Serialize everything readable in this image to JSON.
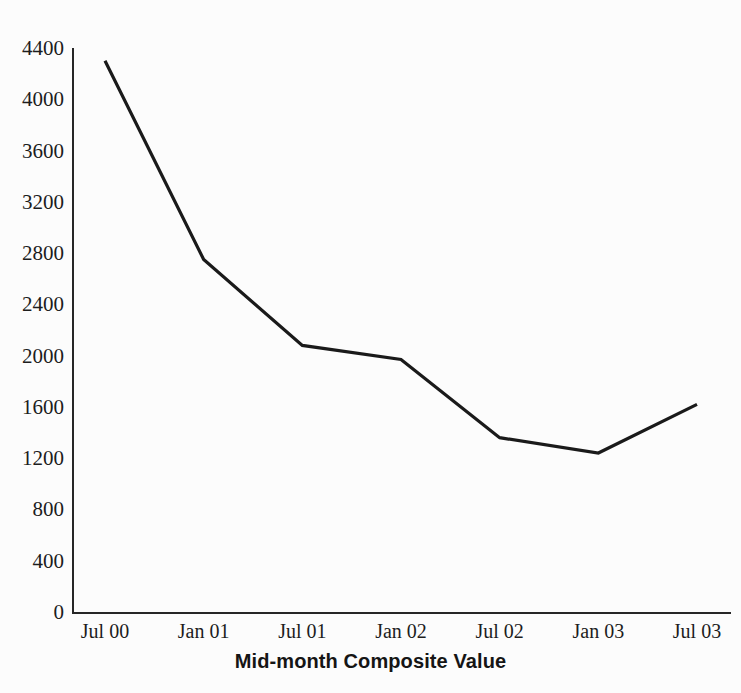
{
  "chart_data": {
    "type": "line",
    "title": "",
    "subtitle": "",
    "xlabel": "Mid-month Composite Value",
    "ylabel": "",
    "categories": [
      "Jul 00",
      "Jan 01",
      "Jul 01",
      "Jan 02",
      "Jul 02",
      "Jan 03",
      "Jul 03"
    ],
    "series": [
      {
        "name": "Composite Value",
        "values": [
          4300,
          2750,
          2080,
          1970,
          1360,
          1240,
          1620
        ]
      }
    ],
    "values": [
      4300,
      2750,
      2080,
      1970,
      1360,
      1240,
      1620
    ],
    "ylim": [
      0,
      4400
    ],
    "y_ticks": [
      0,
      400,
      800,
      1200,
      1600,
      2000,
      2400,
      2800,
      3200,
      3600,
      4000,
      4400
    ],
    "y_tick_labels": [
      "0",
      "400",
      "800",
      "1200",
      "1600",
      "2000",
      "2400",
      "2800",
      "3200",
      "3600",
      "4000",
      "4400"
    ],
    "grid": false,
    "legend": false,
    "legend_position": "none",
    "markers": false,
    "line_color": "#1a1a1a",
    "axis_color": "#262626",
    "background_color": "#fcfcfc"
  },
  "axis": {
    "x_title": "Mid-month Composite Value"
  }
}
